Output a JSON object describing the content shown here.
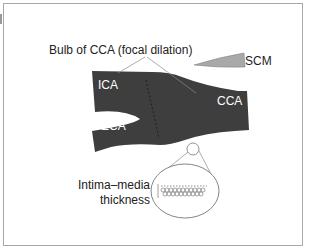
{
  "diagram": {
    "labels": {
      "bulb": "Bulb of CCA (focal dilation)",
      "scm": "SCM",
      "ica": "ICA",
      "eca": "ECA",
      "cca": "CCA",
      "imt_line1": "Intima–media",
      "imt_line2": "thickness"
    },
    "colors": {
      "vessel": "#3e3e3e",
      "scm": "#a9a9a9",
      "lines": "#8a8a8a",
      "frame": "#a8a8a8",
      "text": "#222222"
    }
  }
}
